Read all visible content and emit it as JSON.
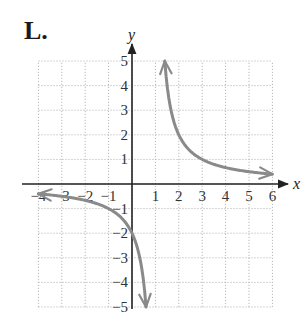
{
  "figure": {
    "label": "L."
  },
  "chart_data": {
    "type": "line",
    "title": "L.",
    "xlabel": "x",
    "ylabel": "y",
    "xlim": [
      -4,
      6
    ],
    "ylim": [
      -5,
      5
    ],
    "grid": true,
    "x_ticks": [
      "-4",
      "-3",
      "-2",
      "-1",
      "1",
      "2",
      "3",
      "4",
      "5",
      "6"
    ],
    "y_ticks": [
      "5",
      "4",
      "3",
      "2",
      "1",
      "-1",
      "-2",
      "-3",
      "-4",
      "-5"
    ],
    "function": "y = 2/(x - 1)",
    "vertical_asymptote": 1,
    "horizontal_asymptote": 0,
    "series": [
      {
        "name": "right branch",
        "x": [
          1.4,
          1.5,
          2,
          3,
          4,
          5,
          6
        ],
        "y": [
          5,
          4,
          2,
          1,
          0.67,
          0.5,
          0.4
        ]
      },
      {
        "name": "left branch",
        "x": [
          -4,
          -3,
          -2,
          -1,
          0,
          0.5,
          0.6
        ],
        "y": [
          -0.4,
          -0.5,
          -0.67,
          -1,
          -2,
          -4,
          -5
        ]
      }
    ],
    "curve_color": "#8a8a8a"
  }
}
